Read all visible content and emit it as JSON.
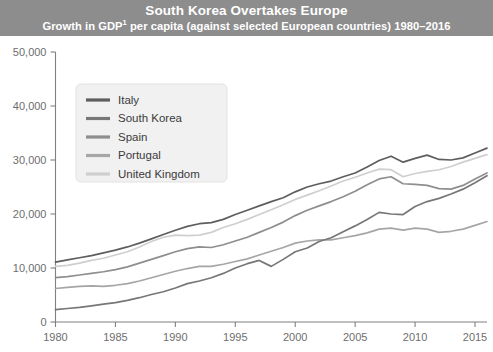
{
  "header": {
    "title": "South Korea Overtakes Europe",
    "subtitle_before": "Growth in GDP",
    "subtitle_superscript": "1",
    "subtitle_after": " per capita (against selected European countries) 1980–2016",
    "background_color": "#8d8d8d",
    "text_color": "#ffffff"
  },
  "chart_data": {
    "type": "line",
    "title": "South Korea Overtakes Europe",
    "subtitle": "Growth in GDP¹ per capita (against selected European countries) 1980–2016",
    "xlabel": "",
    "ylabel": "",
    "xlim": [
      1980,
      2016
    ],
    "ylim": [
      0,
      50000
    ],
    "grid": false,
    "legend_position": "top-left",
    "x_ticks": [
      1980,
      1985,
      1990,
      1995,
      2000,
      2005,
      2010,
      2015
    ],
    "x_tick_labels": [
      "1980",
      "1985",
      "1990",
      "1995",
      "2000",
      "2005",
      "2010",
      "2015"
    ],
    "y_ticks": [
      0,
      10000,
      20000,
      30000,
      40000,
      50000
    ],
    "y_tick_labels": [
      "0",
      "10,000",
      "20,000",
      "30,000",
      "40,000",
      "50,000"
    ],
    "x": [
      1980,
      1981,
      1982,
      1983,
      1984,
      1985,
      1986,
      1987,
      1988,
      1989,
      1990,
      1991,
      1992,
      1993,
      1994,
      1995,
      1996,
      1997,
      1998,
      1999,
      2000,
      2001,
      2002,
      2003,
      2004,
      2005,
      2006,
      2007,
      2008,
      2009,
      2010,
      2011,
      2012,
      2013,
      2014,
      2015,
      2016
    ],
    "series": [
      {
        "name": "Italy",
        "color": "#5e5e5e",
        "values": [
          11100,
          11500,
          11900,
          12300,
          12800,
          13300,
          13900,
          14600,
          15400,
          16200,
          17000,
          17700,
          18200,
          18400,
          19000,
          19900,
          20700,
          21500,
          22300,
          23000,
          24100,
          25000,
          25600,
          26100,
          26900,
          27600,
          28700,
          29900,
          30700,
          29600,
          30300,
          30900,
          30100,
          30000,
          30400,
          31300,
          32200
        ]
      },
      {
        "name": "South Korea",
        "color": "#777777",
        "values": [
          2300,
          2500,
          2700,
          3000,
          3300,
          3600,
          4000,
          4500,
          5100,
          5600,
          6300,
          7100,
          7600,
          8200,
          9000,
          10000,
          10800,
          11400,
          10300,
          11600,
          13000,
          13700,
          14900,
          15600,
          16700,
          17800,
          19000,
          20300,
          20000,
          19900,
          21400,
          22300,
          22900,
          23700,
          24600,
          25800,
          27100
        ]
      },
      {
        "name": "Spain",
        "color": "#8e8e8e",
        "values": [
          8200,
          8400,
          8700,
          9000,
          9300,
          9700,
          10200,
          10900,
          11600,
          12300,
          13000,
          13600,
          13900,
          13800,
          14300,
          15000,
          15700,
          16600,
          17500,
          18500,
          19700,
          20700,
          21500,
          22300,
          23200,
          24200,
          25400,
          26500,
          26900,
          25600,
          25500,
          25300,
          24700,
          24600,
          25300,
          26500,
          27600
        ]
      },
      {
        "name": "Portugal",
        "color": "#a6a6a6",
        "values": [
          6200,
          6400,
          6600,
          6700,
          6600,
          6800,
          7100,
          7600,
          8200,
          8800,
          9400,
          9900,
          10300,
          10300,
          10700,
          11200,
          11700,
          12400,
          13100,
          13800,
          14600,
          15000,
          15200,
          15200,
          15600,
          16000,
          16500,
          17200,
          17400,
          17000,
          17400,
          17200,
          16600,
          16800,
          17200,
          17900,
          18600
        ]
      },
      {
        "name": "United Kingdom",
        "color": "#cfcfcf",
        "values": [
          10300,
          10500,
          10900,
          11400,
          11800,
          12400,
          13000,
          13900,
          14900,
          15700,
          16100,
          16000,
          16100,
          16600,
          17500,
          18200,
          19000,
          19900,
          20800,
          21700,
          22700,
          23500,
          24300,
          25200,
          26100,
          26800,
          27600,
          28300,
          28200,
          26900,
          27500,
          27900,
          28200,
          28800,
          29600,
          30300,
          31000
        ]
      }
    ]
  },
  "legend": {
    "items": [
      {
        "label": "Italy",
        "color": "#5e5e5e"
      },
      {
        "label": "South Korea",
        "color": "#777777"
      },
      {
        "label": "Spain",
        "color": "#8e8e8e"
      },
      {
        "label": "Portugal",
        "color": "#a6a6a6"
      },
      {
        "label": "United Kingdom",
        "color": "#cfcfcf"
      }
    ]
  },
  "axes": {
    "axis_color": "#808080",
    "tick_label_color": "#6e6e6e"
  }
}
